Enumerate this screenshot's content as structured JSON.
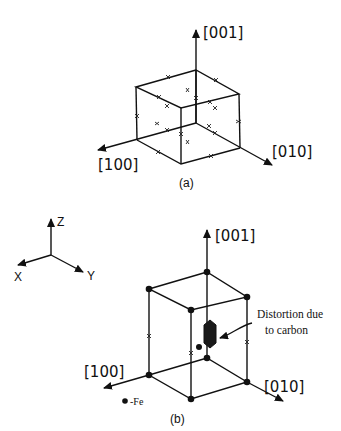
{
  "figure": {
    "panel_a": {
      "caption": "(a)",
      "axes": {
        "z": "[001]",
        "x": "[100]",
        "y": "[010]"
      },
      "description": "Cubic cell with interstitial sites marked by crosses on edges and face centers"
    },
    "panel_b": {
      "caption": "(b)",
      "axes": {
        "z": "[001]",
        "x": "[100]",
        "y": "[010]"
      },
      "reference_axes": {
        "z": "Z",
        "x": "X",
        "y": "Y"
      },
      "annotation": {
        "line1": "Distortion due",
        "line2": "to carbon"
      },
      "legend": {
        "symbol": "●",
        "label": "-Fe"
      }
    },
    "colors": {
      "ink": "#111111",
      "background": "#ffffff"
    }
  }
}
